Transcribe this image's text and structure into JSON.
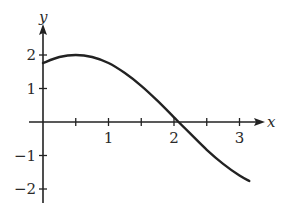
{
  "chart_data": {
    "type": "line",
    "title": "",
    "xlabel": "x",
    "ylabel": "y",
    "xlim": [
      -0.2,
      3.4
    ],
    "ylim": [
      -2.5,
      2.5
    ],
    "grid": false,
    "legend": null,
    "x_ticks": [
      0.5,
      1,
      1.5,
      2,
      2.5,
      3
    ],
    "x_tick_labels": [
      {
        "value": 1,
        "label": "1"
      },
      {
        "value": 2,
        "label": "2"
      },
      {
        "value": 3,
        "label": "3"
      }
    ],
    "y_ticks": [
      2,
      1,
      -1,
      -2
    ],
    "y_tick_labels": [
      {
        "value": 2,
        "label": "2"
      },
      {
        "value": 1,
        "label": "1"
      },
      {
        "value": -1,
        "label": "−1"
      },
      {
        "value": -2,
        "label": "−2"
      }
    ],
    "series": [
      {
        "name": "curve",
        "color": "#222222",
        "x": [
          0,
          0.25,
          0.5,
          0.75,
          1.0,
          1.25,
          1.5,
          1.75,
          2.0,
          2.07,
          2.25,
          2.5,
          2.75,
          3.0,
          3.15
        ],
        "values": [
          1.76,
          1.94,
          2.0,
          1.94,
          1.76,
          1.46,
          1.08,
          0.63,
          0.14,
          0.0,
          -0.35,
          -0.83,
          -1.25,
          -1.6,
          -1.76
        ]
      }
    ],
    "annotations": []
  },
  "plot": {
    "origin_px": [
      43,
      122
    ],
    "x_unit_px": 65.5,
    "y_unit_px": 33.5,
    "axis_color": "#222222",
    "x_axis_label": "x",
    "y_axis_label": "y"
  }
}
